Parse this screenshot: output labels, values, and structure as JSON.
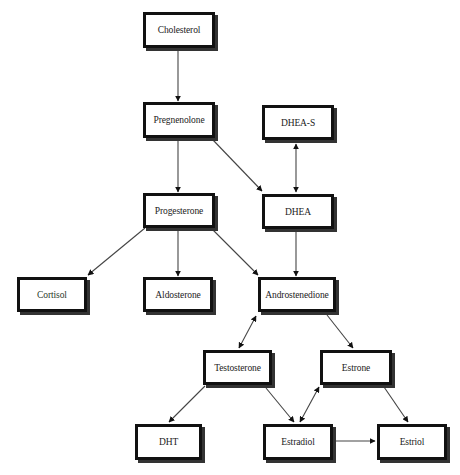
{
  "diagram": {
    "type": "flowchart",
    "title": "",
    "nodes": {
      "cholesterol": {
        "label": "Cholesterol",
        "x": 143,
        "y": 12,
        "w": 72,
        "h": 36
      },
      "pregnenolone": {
        "label": "Pregnenolone",
        "x": 143,
        "y": 102,
        "w": 72,
        "h": 36
      },
      "dhea_s": {
        "label": "DHEA-S",
        "x": 262,
        "y": 105,
        "w": 72,
        "h": 35
      },
      "progesterone": {
        "label": "Progesterone",
        "x": 143,
        "y": 193,
        "w": 72,
        "h": 35
      },
      "dhea": {
        "label": "DHEA",
        "x": 262,
        "y": 194,
        "w": 72,
        "h": 35
      },
      "cortisol": {
        "label": "Cortisol",
        "x": 17,
        "y": 277,
        "w": 70,
        "h": 35
      },
      "aldosterone": {
        "label": "Aldosterone",
        "x": 143,
        "y": 277,
        "w": 70,
        "h": 35
      },
      "androstenedione": {
        "label": "Androstenedione",
        "x": 258,
        "y": 277,
        "w": 78,
        "h": 35
      },
      "testosterone": {
        "label": "Testosterone",
        "x": 203,
        "y": 350,
        "w": 69,
        "h": 35
      },
      "estrone": {
        "label": "Estrone",
        "x": 320,
        "y": 350,
        "w": 72,
        "h": 35
      },
      "dht": {
        "label": "DHT",
        "x": 135,
        "y": 424,
        "w": 67,
        "h": 36
      },
      "estradiol": {
        "label": "Estradiol",
        "x": 263,
        "y": 424,
        "w": 70,
        "h": 36
      },
      "estriol": {
        "label": "Estriol",
        "x": 377,
        "y": 424,
        "w": 70,
        "h": 36
      }
    },
    "edges": [
      {
        "from": "Cholesterol",
        "to": "Pregnenolone",
        "bidirectional": false
      },
      {
        "from": "Pregnenolone",
        "to": "Progesterone",
        "bidirectional": false
      },
      {
        "from": "Pregnenolone",
        "to": "DHEA",
        "bidirectional": false
      },
      {
        "from": "DHEA-S",
        "to": "DHEA",
        "bidirectional": true
      },
      {
        "from": "Progesterone",
        "to": "Cortisol",
        "bidirectional": false
      },
      {
        "from": "Progesterone",
        "to": "Aldosterone",
        "bidirectional": false
      },
      {
        "from": "Progesterone",
        "to": "Androstenedione",
        "bidirectional": false
      },
      {
        "from": "DHEA",
        "to": "Androstenedione",
        "bidirectional": false
      },
      {
        "from": "Androstenedione",
        "to": "Testosterone",
        "bidirectional": true
      },
      {
        "from": "Androstenedione",
        "to": "Estrone",
        "bidirectional": false
      },
      {
        "from": "Testosterone",
        "to": "DHT",
        "bidirectional": false
      },
      {
        "from": "Testosterone",
        "to": "Estradiol",
        "bidirectional": false
      },
      {
        "from": "Estrone",
        "to": "Estradiol",
        "bidirectional": true
      },
      {
        "from": "Estrone",
        "to": "Estriol",
        "bidirectional": false
      },
      {
        "from": "Estradiol",
        "to": "Estriol",
        "bidirectional": false
      }
    ],
    "colors": {
      "border": "#111111",
      "shadow": "#333333",
      "line": "#444444",
      "arrowhead": "#111111",
      "background": "#ffffff"
    }
  }
}
